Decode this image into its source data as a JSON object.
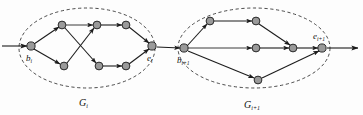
{
  "figure": {
    "background_color": "#fdfdfd",
    "node_fill_color": "#9a9a9a",
    "node_stroke_color": "#1a1a1a",
    "edge_color": "#1c1c1c",
    "boundary_style": "dashed-ellipse"
  },
  "labels": {
    "begin_i": {
      "base": "b",
      "sub": "i"
    },
    "end_i": {
      "base": "e",
      "sub": "i"
    },
    "begin_i_plus_1": {
      "base": "b",
      "sub": "i+1"
    },
    "end_i_plus_1": {
      "base": "e",
      "sub": "i+1"
    },
    "group_i": {
      "base": "G",
      "sub": "i"
    },
    "group_i_plus_1": {
      "base": "G",
      "sub": "i+1"
    }
  },
  "graph_left": {
    "id": "G_i",
    "boundary": {
      "cx": 87,
      "cy": 48,
      "rx": 68,
      "ry": 40
    },
    "nodes": [
      {
        "id": "b_i",
        "x": 31,
        "y": 46,
        "r": 4.1,
        "label": "b_i"
      },
      {
        "id": "u1",
        "x": 62,
        "y": 25,
        "r": 3.9,
        "label": ""
      },
      {
        "id": "u2",
        "x": 97,
        "y": 25,
        "r": 3.9,
        "label": ""
      },
      {
        "id": "u3",
        "x": 126,
        "y": 25,
        "r": 3.9,
        "label": ""
      },
      {
        "id": "d1",
        "x": 64,
        "y": 66,
        "r": 3.9,
        "label": ""
      },
      {
        "id": "d2",
        "x": 99,
        "y": 66,
        "r": 3.9,
        "label": ""
      },
      {
        "id": "d3",
        "x": 126,
        "y": 66,
        "r": 3.9,
        "label": ""
      },
      {
        "id": "e_i",
        "x": 152,
        "y": 46,
        "r": 4.1,
        "label": "e_i"
      }
    ],
    "edges": [
      {
        "from": "b_i",
        "to": "u1"
      },
      {
        "from": "b_i",
        "to": "d1"
      },
      {
        "from": "u1",
        "to": "u2"
      },
      {
        "from": "u1",
        "to": "d2"
      },
      {
        "from": "d1",
        "to": "u2"
      },
      {
        "from": "u2",
        "to": "u3"
      },
      {
        "from": "d2",
        "to": "d3"
      },
      {
        "from": "u3",
        "to": "e_i"
      },
      {
        "from": "d3",
        "to": "e_i"
      }
    ]
  },
  "graph_right": {
    "id": "G_i+1",
    "boundary": {
      "cx": 254,
      "cy": 48,
      "rx": 76,
      "ry": 40
    },
    "nodes": [
      {
        "id": "b_ip1",
        "x": 184,
        "y": 48,
        "r": 4.1,
        "label": "b_i+1"
      },
      {
        "id": "t1",
        "x": 210,
        "y": 21,
        "r": 3.9,
        "label": ""
      },
      {
        "id": "t2",
        "x": 256,
        "y": 21,
        "r": 3.9,
        "label": ""
      },
      {
        "id": "m1",
        "x": 256,
        "y": 48,
        "r": 3.9,
        "label": ""
      },
      {
        "id": "m2",
        "x": 293,
        "y": 48,
        "r": 3.9,
        "label": ""
      },
      {
        "id": "b1",
        "x": 258,
        "y": 80,
        "r": 3.9,
        "label": ""
      },
      {
        "id": "e_ip1",
        "x": 322,
        "y": 48,
        "r": 4.1,
        "label": "e_i+1"
      }
    ],
    "edges": [
      {
        "from": "b_ip1",
        "to": "t1"
      },
      {
        "from": "b_ip1",
        "to": "m1"
      },
      {
        "from": "b_ip1",
        "to": "b1"
      },
      {
        "from": "t1",
        "to": "t2"
      },
      {
        "from": "t2",
        "to": "m2"
      },
      {
        "from": "m1",
        "to": "m2"
      },
      {
        "from": "m2",
        "to": "e_ip1"
      },
      {
        "from": "b1",
        "to": "e_ip1"
      }
    ]
  },
  "connectors": {
    "incoming": {
      "x1": 2,
      "y1": 46,
      "x2": 27,
      "y2": 46
    },
    "between": {
      "x1": 156,
      "y1": 47,
      "x2": 180,
      "y2": 48
    },
    "outgoing": {
      "x1": 326,
      "y1": 48,
      "x2": 358,
      "y2": 48
    }
  }
}
